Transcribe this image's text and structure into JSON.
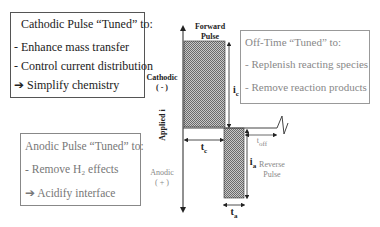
{
  "cathodic_box": {
    "title": "Cathodic Pulse “Tuned” to:",
    "items": [
      "- Enhance mass transfer",
      "- Control current distribution",
      "➔ Simplify chemistry"
    ]
  },
  "anodic_box": {
    "title": "Anodic Pulse “Tuned” to:",
    "items": [
      "- Remove H₂ effects",
      "➔ Acidify interface"
    ]
  },
  "offtime_box": {
    "title": "Off-Time “Tuned” to:",
    "items": [
      "- Replenish reacting species",
      "- Remove reaction products"
    ]
  },
  "diagram": {
    "forward_pulse_label": [
      "Forward",
      "Pulse"
    ],
    "reverse_pulse_label": [
      "Reverse",
      "Pulse"
    ],
    "cathodic_label": [
      "Cathodic",
      "( - )"
    ],
    "anodic_label": [
      "Anodic",
      "( + )"
    ],
    "axis_label": "Applied i",
    "ic_label": "i",
    "ic_sub": "c",
    "ia_label": "i",
    "ia_sub": "a",
    "tc_label": "t",
    "tc_sub": "c",
    "ta_label": "t",
    "ta_sub": "a",
    "toff_label": "t",
    "toff_sub": "off"
  },
  "colors": {
    "shade": "#9a9a9a",
    "line": "#222222",
    "muted_text": "#888888"
  }
}
